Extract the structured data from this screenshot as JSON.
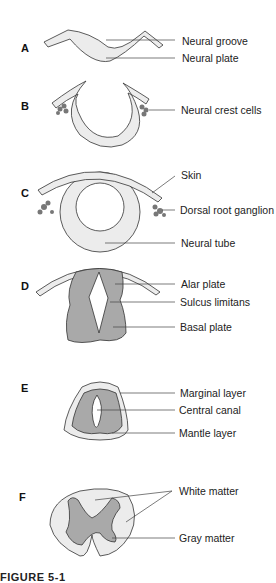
{
  "figure": {
    "caption_partial": "FIGURE 5-1",
    "colors": {
      "light_fill": "#ececec",
      "dark_fill": "#a9a9a9",
      "outline": "#333333",
      "cell_clusters": "#777777",
      "leader_line": "#444444"
    },
    "panels": [
      {
        "id": "A",
        "labels": [
          "Neural groove",
          "Neural plate"
        ]
      },
      {
        "id": "B",
        "labels": [
          "Neural crest cells"
        ]
      },
      {
        "id": "C",
        "labels": [
          "Skin",
          "Dorsal root ganglion",
          "Neural tube"
        ]
      },
      {
        "id": "D",
        "labels": [
          "Alar plate",
          "Sulcus limitans",
          "Basal plate"
        ]
      },
      {
        "id": "E",
        "labels": [
          "Marginal layer",
          "Central canal",
          "Mantle layer"
        ]
      },
      {
        "id": "F",
        "labels": [
          "White matter",
          "Gray matter"
        ]
      }
    ]
  }
}
